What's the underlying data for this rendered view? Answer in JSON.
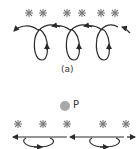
{
  "diagram": {
    "part_a_label": "(a)",
    "point_label": "P",
    "colors": {
      "stroke": "#2b2b2b",
      "star": "#7a7a7a",
      "point": "#a8a8a8",
      "background": "#ffffff"
    },
    "top_row": {
      "star_count": 6,
      "loop_count": 3
    },
    "bottom_row": {
      "star_count": 5,
      "ellipse_loop_count": 2
    }
  }
}
